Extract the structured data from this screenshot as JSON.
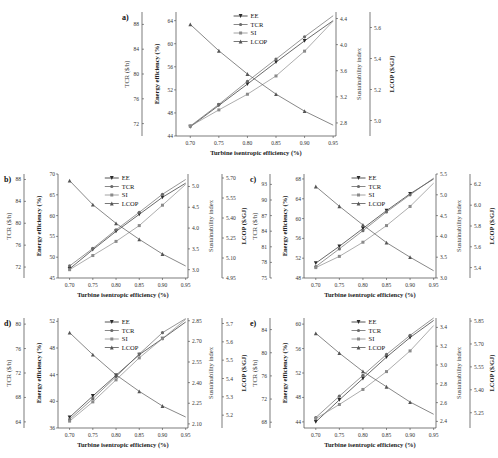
{
  "figure": {
    "x_label": "Turbine isentropic efficiency (%)",
    "legend": [
      "EE",
      "TCR",
      "SI",
      "LCOP"
    ],
    "axis_labels": {
      "tcr": "TCR (S/h)",
      "ee": "Energy efficiency (%)",
      "si": "Sustainability index",
      "lcop": "LCOP ($/GJ)"
    }
  },
  "chart_data": [
    {
      "panel": "a)",
      "type": "line",
      "x": [
        0.7,
        0.75,
        0.8,
        0.85,
        0.9,
        0.95
      ],
      "xlim": [
        0.675,
        0.955
      ],
      "xticks": [
        "0.70",
        "0.75",
        "0.80",
        "0.85",
        "0.90",
        "0.95"
      ],
      "xlabel": "Turbine isentropic efficiency (%)",
      "axes": {
        "tcr": {
          "label": "TCR ($/h)",
          "ticks": [
            72,
            76,
            80,
            84,
            88
          ],
          "lim": [
            70,
            90
          ]
        },
        "ee": {
          "label": "Energy efficiency (%)",
          "ticks": [
            44,
            48,
            52,
            56,
            60,
            64
          ],
          "lim": [
            44,
            65.5
          ]
        },
        "si": {
          "label": "Sustainability index",
          "ticks": [
            2.8,
            3.2,
            3.6,
            4.0,
            4.4
          ],
          "lim": [
            2.6,
            4.5
          ]
        },
        "lcop": {
          "label": "LCOP ($/GJ)",
          "ticks": [
            5.0,
            5.2,
            5.4,
            5.6
          ],
          "lim": [
            4.9,
            5.7
          ]
        }
      },
      "series": [
        {
          "name": "EE",
          "axis": "ee",
          "values": [
            45.6,
            49.3,
            53.0,
            56.8,
            60.5,
            64.0
          ]
        },
        {
          "name": "TCR",
          "axis": "tcr",
          "values": [
            71.6,
            75.1,
            78.8,
            82.4,
            86.0,
            89.4
          ]
        },
        {
          "name": "SI",
          "axis": "si",
          "values": [
            2.75,
            3.0,
            3.24,
            3.52,
            3.9,
            4.36
          ]
        },
        {
          "name": "LCOP",
          "axis": "lcop",
          "values": [
            5.62,
            5.45,
            5.3,
            5.17,
            5.06,
            4.97
          ]
        }
      ],
      "legend_position": "upper center"
    },
    {
      "panel": "b)",
      "type": "line",
      "x": [
        0.7,
        0.75,
        0.8,
        0.85,
        0.9,
        0.95
      ],
      "xlim": [
        0.675,
        0.955
      ],
      "xticks": [
        "0.70",
        "0.75",
        "0.80",
        "0.85",
        "0.90",
        "0.95"
      ],
      "xlabel": "Turbine isentropic efficiency (%)",
      "axes": {
        "tcr": {
          "label": "TCR ($/h)",
          "ticks": [
            72,
            76,
            80,
            84,
            88
          ],
          "lim": [
            70,
            89
          ]
        },
        "ee": {
          "label": "Energy efficiency (%)",
          "ticks": [
            45,
            50,
            55,
            60,
            65,
            70
          ],
          "lim": [
            45,
            70
          ]
        },
        "si": {
          "label": "Sustainability index",
          "ticks": [
            3.0,
            3.5,
            4.0,
            4.5,
            5.0
          ],
          "lim": [
            2.8,
            5.3
          ]
        },
        "lcop": {
          "label": "LCOP ($/GJ)",
          "ticks": [
            4.95,
            5.1,
            5.25,
            5.4,
            5.55,
            5.7
          ],
          "lim": [
            4.95,
            5.73
          ]
        }
      },
      "series": [
        {
          "name": "EE",
          "axis": "ee",
          "values": [
            47.2,
            51.8,
            56.2,
            60.3,
            64.4,
            67.8
          ]
        },
        {
          "name": "TCR",
          "axis": "tcr",
          "values": [
            72.2,
            75.4,
            78.8,
            82.0,
            85.3,
            88.0
          ]
        },
        {
          "name": "SI",
          "axis": "si",
          "values": [
            3.0,
            3.34,
            3.68,
            4.06,
            4.55,
            5.05
          ]
        },
        {
          "name": "LCOP",
          "axis": "lcop",
          "values": [
            5.68,
            5.5,
            5.36,
            5.24,
            5.13,
            5.04
          ]
        }
      ],
      "legend_position": "upper center"
    },
    {
      "panel": "c)",
      "type": "line",
      "x": [
        0.7,
        0.75,
        0.8,
        0.85,
        0.9,
        0.95
      ],
      "xlim": [
        0.675,
        0.955
      ],
      "xticks": [
        "0.70",
        "0.75",
        "0.80",
        "0.85",
        "0.90",
        "0.95"
      ],
      "xlabel": "Turbine isentropic efficiency (%)",
      "axes": {
        "tcr": {
          "label": "TCR ($/h)",
          "ticks": [
            75,
            78,
            81,
            84,
            87,
            90,
            93
          ],
          "lim": [
            75,
            95
          ]
        },
        "ee": {
          "label": "Energy efficiency (%)",
          "ticks": [
            48,
            52,
            56,
            60,
            64,
            68
          ],
          "lim": [
            48,
            69
          ]
        },
        "si": {
          "label": "Sustainability index",
          "ticks": [
            3.0,
            3.5,
            4.0,
            4.5,
            5.0,
            5.5
          ],
          "lim": [
            3.0,
            5.5
          ]
        },
        "lcop": {
          "label": "LCOP ($/GJ)",
          "ticks": [
            5.4,
            5.6,
            5.8,
            6.0,
            6.2
          ],
          "lim": [
            5.3,
            6.3
          ]
        }
      },
      "series": [
        {
          "name": "EE",
          "axis": "ee",
          "values": [
            51.0,
            54.4,
            58.0,
            61.6,
            65.0,
            68.0
          ]
        },
        {
          "name": "TCR",
          "axis": "tcr",
          "values": [
            77.2,
            80.6,
            84.1,
            87.7,
            91.0,
            94.2
          ]
        },
        {
          "name": "SI",
          "axis": "si",
          "values": [
            3.25,
            3.52,
            3.86,
            4.26,
            4.72,
            5.28
          ]
        },
        {
          "name": "LCOP",
          "axis": "lcop",
          "values": [
            6.18,
            5.99,
            5.81,
            5.64,
            5.5,
            5.37
          ]
        }
      ],
      "legend_position": "upper center"
    },
    {
      "panel": "d)",
      "type": "line",
      "x": [
        0.7,
        0.75,
        0.8,
        0.85,
        0.9,
        0.95
      ],
      "xlim": [
        0.675,
        0.955
      ],
      "xticks": [
        "0.70",
        "0.75",
        "0.80",
        "0.85",
        "0.90",
        "0.95"
      ],
      "xlabel": "Turbine isentropic efficiency (%)",
      "axes": {
        "tcr": {
          "label": "TCR ($/h)",
          "ticks": [
            64,
            68,
            72,
            76,
            80
          ],
          "lim": [
            63,
            81
          ]
        },
        "ee": {
          "label": "Energy efficiency (%)",
          "ticks": [
            36,
            40,
            44,
            48,
            52
          ],
          "lim": [
            36,
            52.5
          ]
        },
        "si": {
          "label": "Sustainability index",
          "ticks": [
            2.1,
            2.25,
            2.4,
            2.55,
            2.7,
            2.85
          ],
          "lim": [
            2.07,
            2.87
          ]
        },
        "lcop": {
          "label": "LCOP ($/GJ)",
          "ticks": [
            5.2,
            5.3,
            5.4,
            5.5,
            5.6,
            5.7
          ],
          "lim": [
            5.13,
            5.73
          ]
        }
      },
      "series": [
        {
          "name": "EE",
          "axis": "ee",
          "values": [
            37.6,
            40.8,
            43.9,
            47.0,
            49.4,
            51.9
          ]
        },
        {
          "name": "TCR",
          "axis": "tcr",
          "values": [
            64.4,
            67.8,
            71.4,
            75.1,
            78.6,
            80.9
          ]
        },
        {
          "name": "SI",
          "axis": "si",
          "values": [
            2.12,
            2.26,
            2.42,
            2.58,
            2.72,
            2.86
          ]
        },
        {
          "name": "LCOP",
          "axis": "lcop",
          "values": [
            5.65,
            5.53,
            5.42,
            5.33,
            5.25,
            5.19
          ]
        }
      ],
      "legend_position": "upper center"
    },
    {
      "panel": "e)",
      "type": "line",
      "x": [
        0.7,
        0.75,
        0.8,
        0.85,
        0.9,
        0.95
      ],
      "xlim": [
        0.675,
        0.955
      ],
      "xticks": [
        "0.70",
        "0.75",
        "0.80",
        "0.85",
        "0.90",
        "0.95"
      ],
      "xlabel": "Turbine isentropic efficiency (%)",
      "axes": {
        "tcr": {
          "label": "TCR ($/h)",
          "ticks": [
            68,
            72,
            76,
            80,
            84
          ],
          "lim": [
            67,
            86
          ]
        },
        "ee": {
          "label": "Energy efficiency (%)",
          "ticks": [
            44,
            48,
            52,
            56,
            60
          ],
          "lim": [
            43,
            61
          ]
        },
        "si": {
          "label": "Sustainability index",
          "ticks": [
            2.4,
            2.6,
            2.8,
            3.0,
            3.2,
            3.4
          ],
          "lim": [
            2.33,
            3.5
          ]
        },
        "lcop": {
          "label": "LCOP ($/GJ)",
          "ticks": [
            5.25,
            5.4,
            5.55,
            5.7,
            5.85
          ],
          "lim": [
            5.15,
            5.87
          ]
        }
      },
      "series": [
        {
          "name": "EE",
          "axis": "ee",
          "values": [
            44.0,
            47.6,
            51.1,
            54.6,
            57.8,
            60.6
          ]
        },
        {
          "name": "TCR",
          "axis": "tcr",
          "values": [
            68.8,
            72.5,
            76.1,
            79.7,
            83.0,
            86.0
          ]
        },
        {
          "name": "SI",
          "axis": "si",
          "values": [
            2.43,
            2.58,
            2.74,
            2.93,
            3.15,
            3.42
          ]
        },
        {
          "name": "LCOP",
          "axis": "lcop",
          "values": [
            5.77,
            5.64,
            5.52,
            5.42,
            5.32,
            5.24
          ]
        }
      ],
      "legend_position": "upper center"
    }
  ],
  "colors": {
    "EE": "#2a2a2a",
    "TCR": "#6a6a6a",
    "SI": "#8a8a8a",
    "LCOP": "#555555",
    "axis": "#444444"
  }
}
